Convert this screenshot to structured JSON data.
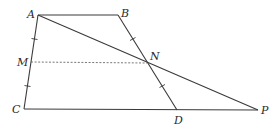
{
  "diagram": {
    "type": "geometry-figure",
    "points": {
      "A": {
        "label": "A",
        "x": 38,
        "y": 15
      },
      "B": {
        "label": "B",
        "x": 118,
        "y": 15
      },
      "C": {
        "label": "C",
        "x": 24,
        "y": 109
      },
      "D": {
        "label": "D",
        "x": 177,
        "y": 110
      },
      "M": {
        "label": "M",
        "x": 31,
        "y": 62
      },
      "N": {
        "label": "N",
        "x": 147,
        "y": 63
      },
      "P": {
        "label": "P",
        "x": 258,
        "y": 110
      }
    },
    "segments": [
      {
        "from": "A",
        "to": "B",
        "style": "solid"
      },
      {
        "from": "A",
        "to": "C",
        "style": "solid"
      },
      {
        "from": "C",
        "to": "P",
        "style": "solid"
      },
      {
        "from": "B",
        "to": "D",
        "style": "solid"
      },
      {
        "from": "A",
        "to": "P",
        "style": "solid"
      },
      {
        "from": "M",
        "to": "N",
        "style": "dashed"
      }
    ],
    "equal_marks": [
      {
        "segment": "AM",
        "marks": 1
      },
      {
        "segment": "MC",
        "marks": 1
      },
      {
        "segment": "BN",
        "marks": 1
      },
      {
        "segment": "ND",
        "marks": 1
      }
    ]
  }
}
